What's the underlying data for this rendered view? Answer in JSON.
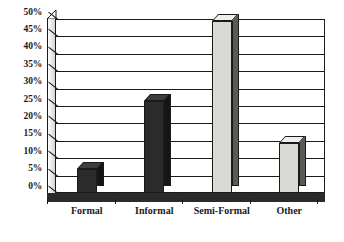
{
  "chart_data": {
    "type": "bar",
    "title": "",
    "subtitle": "",
    "xlabel": "",
    "ylabel": "",
    "categories": [
      "Formal",
      "Informal",
      "Semi-Formal",
      "Other"
    ],
    "values": [
      7,
      26.5,
      49.5,
      14.5
    ],
    "series": [
      {
        "name": "Percentage of respondents",
        "values": [
          7,
          26.5,
          49.5,
          14.5
        ]
      }
    ],
    "ylim": [
      0,
      50
    ],
    "ytick_labels": [
      "0%",
      "5%",
      "10%",
      "15%",
      "20%",
      "25%",
      "30%",
      "35%",
      "40%",
      "45%",
      "50%"
    ],
    "ytick_values": [
      0,
      5,
      10,
      15,
      20,
      25,
      30,
      35,
      40,
      45,
      50
    ],
    "grid": true,
    "grid_axis": "y",
    "legend": false,
    "legend_position": "none",
    "style": "3d-column",
    "bar_colors": [
      "#2b2b2b",
      "#2b2b2b",
      "#d9d9d6",
      "#d9d9d6"
    ],
    "annotations": []
  },
  "colors": {
    "background": "#ffffff",
    "axis": "#1a1a1a",
    "grid": "#1a1a1a",
    "bar_dark": "#2b2b2b",
    "bar_light": "#d9d9d6",
    "floor": "#2b2b2b",
    "wall": "#cfcfcf"
  }
}
